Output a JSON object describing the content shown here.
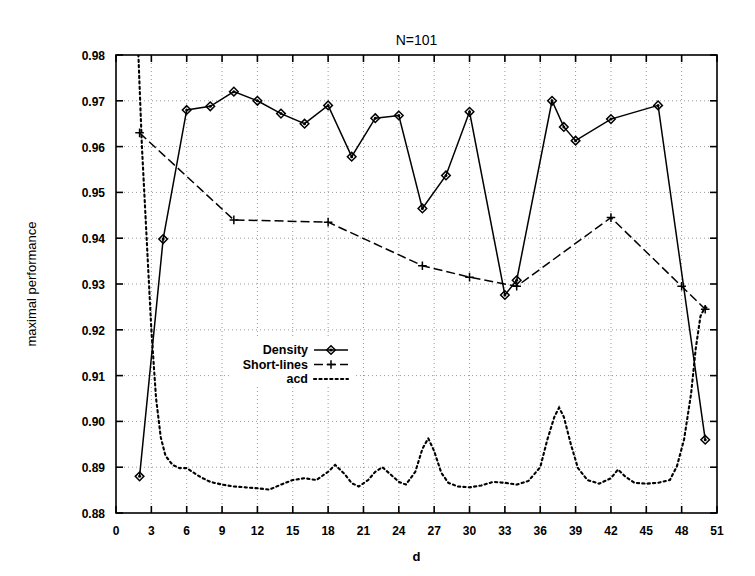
{
  "chart_data": {
    "type": "line",
    "title": "N=101",
    "xlabel": "d",
    "ylabel": "maximal performance",
    "xlim": [
      0,
      51
    ],
    "ylim": [
      0.88,
      0.98
    ],
    "xticks": [
      0,
      3,
      6,
      9,
      12,
      15,
      18,
      21,
      24,
      27,
      30,
      33,
      36,
      39,
      42,
      45,
      48,
      51
    ],
    "yticks": [
      "0.88",
      "0.89",
      "0.90",
      "0.91",
      "0.92",
      "0.93",
      "0.94",
      "0.95",
      "0.96",
      "0.97",
      "0.98"
    ],
    "ytick_values": [
      0.88,
      0.89,
      0.9,
      0.91,
      0.92,
      0.93,
      0.94,
      0.95,
      0.96,
      0.97,
      0.98
    ],
    "grid": true,
    "legend_position": "center-left",
    "series": [
      {
        "name": "Density",
        "style": "solid",
        "marker": "diamond",
        "color": "#000000",
        "points": [
          [
            2,
            0.888
          ],
          [
            4,
            0.9398
          ],
          [
            6,
            0.968
          ],
          [
            8,
            0.9688
          ],
          [
            10,
            0.972
          ],
          [
            12,
            0.97
          ],
          [
            14,
            0.9672
          ],
          [
            16,
            0.965
          ],
          [
            18,
            0.969
          ],
          [
            20,
            0.9578
          ],
          [
            22,
            0.9662
          ],
          [
            24,
            0.9668
          ],
          [
            26,
            0.9465
          ],
          [
            28,
            0.9537
          ],
          [
            30,
            0.9676
          ],
          [
            33,
            0.9276
          ],
          [
            34,
            0.9308
          ],
          [
            37,
            0.97
          ],
          [
            38,
            0.9643
          ],
          [
            39,
            0.9613
          ],
          [
            42,
            0.966
          ],
          [
            46,
            0.969
          ],
          [
            50,
            0.896
          ]
        ]
      },
      {
        "name": "Short-lines",
        "style": "dashed",
        "marker": "plus",
        "color": "#000000",
        "points": [
          [
            2,
            0.963
          ],
          [
            10,
            0.944
          ],
          [
            18,
            0.9435
          ],
          [
            26,
            0.934
          ],
          [
            30,
            0.9315
          ],
          [
            34,
            0.9295
          ],
          [
            42,
            0.9445
          ],
          [
            48,
            0.9295
          ],
          [
            50,
            0.9245
          ]
        ]
      },
      {
        "name": "acd",
        "style": "dotted",
        "marker": "none",
        "color": "#000000",
        "points": [
          [
            1.6,
            0.999
          ],
          [
            1.9,
            0.98
          ],
          [
            2.2,
            0.96
          ],
          [
            2.6,
            0.94
          ],
          [
            3.0,
            0.92
          ],
          [
            3.4,
            0.905
          ],
          [
            3.8,
            0.8965
          ],
          [
            4.2,
            0.8925
          ],
          [
            4.8,
            0.8905
          ],
          [
            5.4,
            0.8898
          ],
          [
            6.0,
            0.8898
          ],
          [
            6.6,
            0.8888
          ],
          [
            7.2,
            0.8878
          ],
          [
            8.0,
            0.8868
          ],
          [
            9.0,
            0.8862
          ],
          [
            10.0,
            0.8858
          ],
          [
            11.0,
            0.8856
          ],
          [
            12.0,
            0.8854
          ],
          [
            13.0,
            0.8851
          ],
          [
            14.0,
            0.8862
          ],
          [
            15.0,
            0.8872
          ],
          [
            16.0,
            0.8876
          ],
          [
            17.0,
            0.8872
          ],
          [
            18.0,
            0.889
          ],
          [
            18.6,
            0.8905
          ],
          [
            19.4,
            0.8885
          ],
          [
            20.0,
            0.8865
          ],
          [
            20.6,
            0.8858
          ],
          [
            21.4,
            0.8872
          ],
          [
            22.0,
            0.889
          ],
          [
            22.6,
            0.89
          ],
          [
            23.4,
            0.8882
          ],
          [
            24.0,
            0.8868
          ],
          [
            24.6,
            0.8862
          ],
          [
            25.4,
            0.889
          ],
          [
            26.0,
            0.894
          ],
          [
            26.5,
            0.8963
          ],
          [
            27.0,
            0.8935
          ],
          [
            27.6,
            0.8888
          ],
          [
            28.2,
            0.8866
          ],
          [
            29.0,
            0.8858
          ],
          [
            30.0,
            0.8856
          ],
          [
            31.0,
            0.886
          ],
          [
            32.0,
            0.8868
          ],
          [
            33.0,
            0.8866
          ],
          [
            34.0,
            0.8862
          ],
          [
            35.0,
            0.887
          ],
          [
            36.0,
            0.89
          ],
          [
            36.6,
            0.896
          ],
          [
            37.2,
            0.901
          ],
          [
            37.6,
            0.903
          ],
          [
            38.0,
            0.901
          ],
          [
            38.6,
            0.895
          ],
          [
            39.2,
            0.8898
          ],
          [
            40.0,
            0.8872
          ],
          [
            41.0,
            0.8864
          ],
          [
            42.0,
            0.8876
          ],
          [
            42.6,
            0.8895
          ],
          [
            43.2,
            0.888
          ],
          [
            44.0,
            0.8866
          ],
          [
            45.0,
            0.8864
          ],
          [
            46.0,
            0.8866
          ],
          [
            47.0,
            0.8872
          ],
          [
            47.6,
            0.8902
          ],
          [
            48.2,
            0.896
          ],
          [
            48.8,
            0.906
          ],
          [
            49.2,
            0.916
          ],
          [
            49.6,
            0.923
          ],
          [
            50.0,
            0.925
          ],
          [
            50.3,
            0.9245
          ]
        ]
      }
    ]
  },
  "legend": {
    "entries": [
      {
        "label": "Density"
      },
      {
        "label": "Short-lines"
      },
      {
        "label": "acd"
      }
    ]
  }
}
